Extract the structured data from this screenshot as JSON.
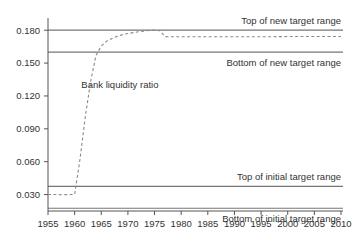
{
  "chart_data": {
    "type": "line",
    "title": "",
    "subtitle": "",
    "xlabel": "",
    "ylabel": "",
    "xlim": [
      1955,
      2010
    ],
    "ylim": [
      0.015,
      0.1875
    ],
    "grid": false,
    "legend_position": "none",
    "x_ticks": [
      1955,
      1960,
      1965,
      1970,
      1975,
      1980,
      1985,
      1990,
      1995,
      2000,
      2005,
      2010
    ],
    "x_tick_labels": [
      "1955",
      "1960",
      "1965",
      "1970",
      "1975",
      "1980",
      "1985",
      "1990",
      "1995",
      "2000",
      "2005",
      "2010"
    ],
    "y_ticks": [
      0.03,
      0.06,
      0.09,
      0.12,
      0.15,
      0.18
    ],
    "y_tick_labels": [
      "0.030",
      "0.060",
      "0.090",
      "0.120",
      "0.150",
      "0.180"
    ],
    "series": [
      {
        "name": "Bank liquidity ratio",
        "style": "dashed",
        "color": "#8a8a8a",
        "x": [
          1955,
          1956,
          1957,
          1958,
          1959,
          1960,
          1961,
          1962,
          1963,
          1964,
          1965,
          1966,
          1967,
          1968,
          1969,
          1970,
          1971,
          1972,
          1973,
          1974,
          1975,
          1976,
          1977,
          1978,
          1980,
          1985,
          1990,
          1995,
          2000,
          2005,
          2010
        ],
        "y": [
          0.03,
          0.03,
          0.03,
          0.0298,
          0.03,
          0.0302,
          0.062,
          0.101,
          0.133,
          0.157,
          0.1655,
          0.17,
          0.1725,
          0.1745,
          0.176,
          0.177,
          0.1778,
          0.1786,
          0.1792,
          0.1797,
          0.18,
          0.1795,
          0.1742,
          0.174,
          0.174,
          0.174,
          0.174,
          0.174,
          0.1742,
          0.1742,
          0.1742
        ]
      }
    ],
    "reference_lines": [
      {
        "name": "top-of-new-target-range",
        "value": 0.18,
        "label": "Top of new target range",
        "label_position": "above-right"
      },
      {
        "name": "bottom-of-new-target-range",
        "value": 0.16,
        "label": "Bottom of new target range",
        "label_position": "below-right"
      },
      {
        "name": "top-of-initial-target-range",
        "value": 0.0375,
        "label": "Top of initial target range",
        "label_position": "above-right"
      },
      {
        "name": "bottom-of-initial-target-range",
        "value": 0.0175,
        "label": "Bottom of initial target range",
        "label_position": "below-right"
      }
    ],
    "annotations": [
      {
        "name": "series-label",
        "text": "Bank liquidity ratio",
        "x": 1968.5,
        "y": 0.1275
      }
    ]
  },
  "labels": {
    "y_0": "0.180",
    "y_1": "0.150",
    "y_2": "0.120",
    "y_3": "0.090",
    "y_4": "0.060",
    "y_5": "0.030",
    "x_0": "1955",
    "x_1": "1960",
    "x_2": "1965",
    "x_3": "1970",
    "x_4": "1975",
    "x_5": "1980",
    "x_6": "1985",
    "x_7": "1990",
    "x_8": "1995",
    "x_9": "2000",
    "x_10": "2005",
    "x_11": "2010",
    "top_new": "Top of new target range",
    "bottom_new": "Bottom of new target range",
    "top_initial": "Top of initial target range",
    "bottom_initial": "Bottom of initial target range",
    "series_name": "Bank liquidity ratio"
  },
  "colors": {
    "axis": "#555555",
    "reference_line": "#767676",
    "series": "#8a8a8a",
    "text": "#333333",
    "background": "#ffffff"
  }
}
